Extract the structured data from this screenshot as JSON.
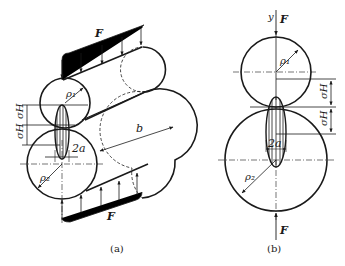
{
  "diagram": {
    "type": "Hertz contact stress between two cylinders",
    "subfigures": [
      {
        "caption": "(a)",
        "view": "isometric",
        "labels": {
          "force": "F",
          "force_bottom": "F",
          "radius_top": "ρ₁",
          "radius_bottom": "ρ₂",
          "stress_top": "σH",
          "stress_bottom": "σH",
          "contact_width": "2a",
          "length": "b"
        }
      },
      {
        "caption": "(b)",
        "view": "front",
        "labels": {
          "axis": "y",
          "force_top": "F",
          "force_bottom": "F",
          "radius_top": "ρ₁",
          "radius_bottom": "ρ₂",
          "stress_top": "σH",
          "stress_bottom": "σH",
          "contact_width": "2a"
        }
      }
    ]
  }
}
